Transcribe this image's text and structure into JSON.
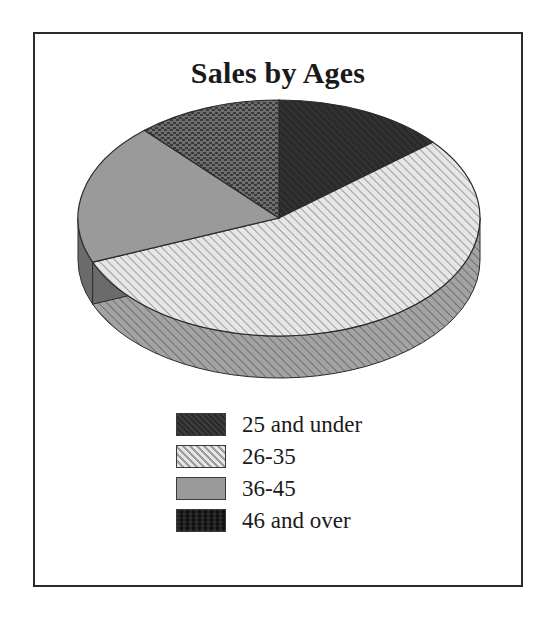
{
  "figure": {
    "border_color": "#2b2b2b",
    "background": "#ffffff"
  },
  "chart_data": {
    "type": "pie",
    "title": "Sales by Ages",
    "subtitle": "",
    "xlabel": "",
    "ylabel": "",
    "legend_position": "bottom",
    "three_d": true,
    "start_angle_deg": 0,
    "direction": "clockwise",
    "categories": [
      "25 and under",
      "26-35",
      "36-45",
      "46 and over"
    ],
    "values": [
      14,
      55,
      19,
      12
    ],
    "units": "percent",
    "slices": [
      {
        "label": "25 and under",
        "value": 14,
        "percent": 14,
        "start_deg": 0,
        "end_deg": 50,
        "fill": "#2f2f2f",
        "side_fill": "#202020",
        "pattern": "solid-dark"
      },
      {
        "label": "26-35",
        "value": 55,
        "percent": 55,
        "start_deg": 50,
        "end_deg": 248,
        "fill": "#e3e3e3",
        "side_fill": "#8e8e8e",
        "pattern": "diagonal-hatch"
      },
      {
        "label": "36-45",
        "value": 19,
        "percent": 19,
        "start_deg": 248,
        "end_deg": 318,
        "fill": "#9a9a9a",
        "side_fill": "#6a6a6a",
        "pattern": "solid-gray"
      },
      {
        "label": "46 and over",
        "value": 12,
        "percent": 12,
        "start_deg": 318,
        "end_deg": 360,
        "fill": "#6e6e6e",
        "side_fill": "#4d4d4d",
        "pattern": "dotted-dark"
      }
    ]
  },
  "legend": {
    "items": [
      {
        "label": "25 and under",
        "swatch_class": "sw-dark",
        "pattern": "solid-dark"
      },
      {
        "label": "26-35",
        "swatch_class": "sw-hatch",
        "pattern": "diagonal-hatch"
      },
      {
        "label": "36-45",
        "swatch_class": "sw-gray",
        "pattern": "solid-gray"
      },
      {
        "label": "46 and over",
        "swatch_class": "sw-dot",
        "pattern": "dotted-dark"
      }
    ]
  }
}
